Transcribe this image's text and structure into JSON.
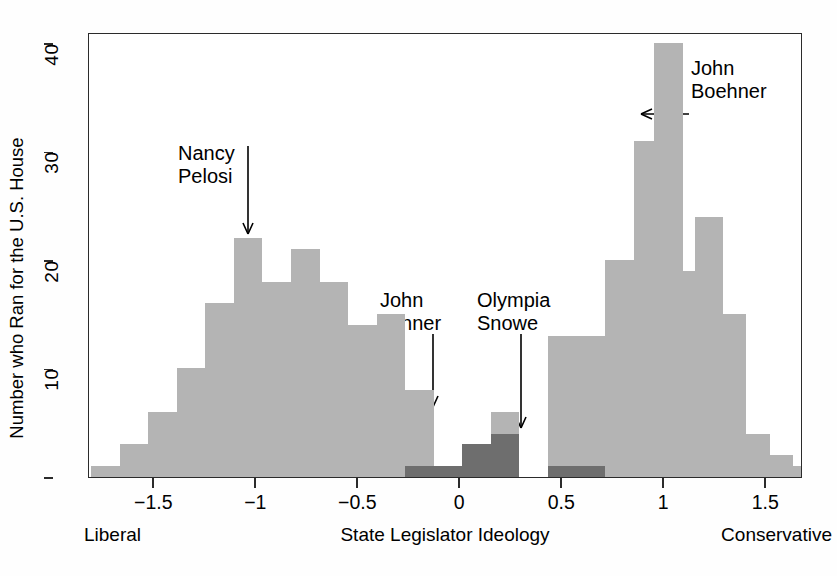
{
  "chart_data": {
    "type": "bar",
    "title": "",
    "subtitle": "",
    "xlabel": "State Legislator Ideology",
    "ylabel": "Number who Ran for the U.S. House",
    "xlim": [
      -1.82,
      1.68
    ],
    "ylim": [
      0,
      41
    ],
    "xticks": [
      -1.5,
      -1,
      -0.5,
      0,
      0.5,
      1,
      1.5
    ],
    "xticklabels": [
      "−1.5",
      "−1",
      "−0.5",
      "0",
      "0.5",
      "1",
      "1.5"
    ],
    "yticks": [
      0,
      10,
      20,
      30,
      40
    ],
    "yticklabels": [
      "",
      "10",
      "20",
      "30",
      "40"
    ],
    "grid": false,
    "legend": false,
    "bin_width": 0.14,
    "axis_end_labels": {
      "left": "Liberal",
      "right": "Conservative"
    },
    "series": [
      {
        "name": "Ran for U.S. House",
        "color": "#b4b4b4",
        "bins": [
          {
            "x": -1.74,
            "value": 1
          },
          {
            "x": -1.6,
            "value": 3
          },
          {
            "x": -1.46,
            "value": 6
          },
          {
            "x": -1.32,
            "value": 10
          },
          {
            "x": -1.18,
            "value": 16
          },
          {
            "x": -1.04,
            "value": 22
          },
          {
            "x": -0.9,
            "value": 18
          },
          {
            "x": -0.76,
            "value": 21
          },
          {
            "x": -0.62,
            "value": 18
          },
          {
            "x": -0.48,
            "value": 14
          },
          {
            "x": -0.34,
            "value": 15
          },
          {
            "x": -0.2,
            "value": 8
          },
          {
            "x": -0.06,
            "value": 0
          },
          {
            "x": 0.08,
            "value": 3
          },
          {
            "x": 0.22,
            "value": 6
          },
          {
            "x": 0.36,
            "value": 0
          },
          {
            "x": 0.5,
            "value": 13
          },
          {
            "x": 0.64,
            "value": 13
          },
          {
            "x": 0.78,
            "value": 20
          },
          {
            "x": 0.92,
            "value": 31
          },
          {
            "x": 1.02,
            "value": 40
          },
          {
            "x": 1.12,
            "value": 19
          },
          {
            "x": 1.22,
            "value": 24
          },
          {
            "x": 1.33,
            "value": 15
          },
          {
            "x": 1.45,
            "value": 4
          },
          {
            "x": 1.56,
            "value": 2
          },
          {
            "x": 1.64,
            "value": 1
          }
        ]
      },
      {
        "name": "Highlighted moderates",
        "color": "#6e6e6e",
        "bins": [
          {
            "x": -0.2,
            "value": 1
          },
          {
            "x": -0.06,
            "value": 1
          },
          {
            "x": 0.08,
            "value": 3
          },
          {
            "x": 0.22,
            "value": 4
          },
          {
            "x": 0.5,
            "value": 1
          },
          {
            "x": 0.64,
            "value": 1
          }
        ]
      }
    ],
    "annotations": [
      {
        "id": "nancy-pelosi",
        "label": "Nancy\nPelosi",
        "text_x_px": 177,
        "text_y_px": 141,
        "arrow_from_x_px": 247,
        "arrow_from_y_px": 145,
        "arrow_to_x_px": 247,
        "arrow_to_y_px": 233,
        "direction": "down"
      },
      {
        "id": "john-tanner",
        "label": "John\nTanner",
        "text_x_px": 379,
        "text_y_px": 288,
        "arrow_from_x_px": 432,
        "arrow_from_y_px": 333,
        "arrow_to_x_px": 432,
        "arrow_to_y_px": 406,
        "direction": "down"
      },
      {
        "id": "olympia-snowe",
        "label": "Olympia\nSnowe",
        "text_x_px": 476,
        "text_y_px": 288,
        "arrow_from_x_px": 520,
        "arrow_from_y_px": 333,
        "arrow_to_x_px": 520,
        "arrow_to_y_px": 427,
        "direction": "down"
      },
      {
        "id": "john-boehner",
        "label": "John\nBoehner",
        "text_x_px": 690,
        "text_y_px": 56,
        "arrow_from_x_px": 688,
        "arrow_from_y_px": 113,
        "arrow_to_x_px": 640,
        "arrow_to_y_px": 113,
        "direction": "left"
      }
    ],
    "colors": {
      "bar_light": "#b4b4b4",
      "bar_dark": "#6e6e6e",
      "axis": "#2b2b2b",
      "background": "#ffffff",
      "text": "#000000"
    }
  }
}
